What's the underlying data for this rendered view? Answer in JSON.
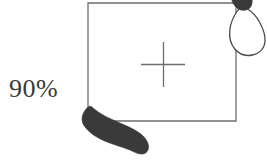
{
  "figure": {
    "kind": "footprint-placement-diagram",
    "background_color": "#ffffff",
    "width": 267,
    "height": 161,
    "percent_label": "90%",
    "label_color": "#3a3a3a",
    "line_color": "#6e6e6e",
    "outline_color": "#4a4a4a",
    "fill_color": "#3a3a3a",
    "box": {
      "name": "target-region-box",
      "x": 88,
      "y": 3,
      "width": 148,
      "height": 118,
      "stroke_width": 1.2,
      "filled": false
    },
    "crosshair": {
      "name": "center-crosshair",
      "center_x": 163,
      "center_y": 64,
      "arm_length": 22,
      "stroke_width": 1.2
    },
    "footprints": [
      {
        "name": "filled-footprint-lower-left",
        "style": "filled",
        "fill": "#3a3a3a",
        "position": "bottom-left",
        "x": 80,
        "y": 103,
        "width": 70,
        "height": 52
      },
      {
        "name": "outlined-footprint-upper-right",
        "style": "outline",
        "fill": "#ffffff",
        "stroke": "#4a4a4a",
        "heel_fill": "#3a3a3a",
        "position": "top-right",
        "x": 226,
        "y": 0,
        "width": 40,
        "height": 62
      }
    ]
  }
}
